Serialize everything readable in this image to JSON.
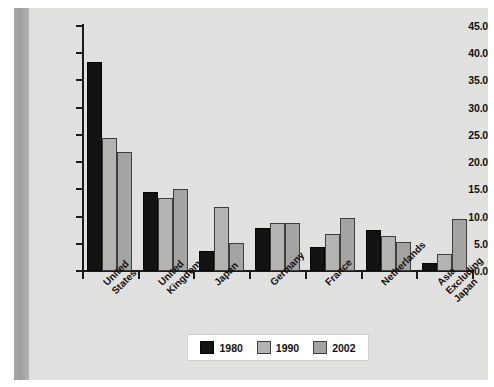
{
  "chart_data": {
    "type": "bar",
    "title": "",
    "subtitle": "",
    "xlabel": "",
    "ylabel": "",
    "ylim": [
      0.0,
      45.0
    ],
    "ytick_labels": [
      "0.0",
      "5.0",
      "10.0",
      "15.0",
      "20.0",
      "25.0",
      "30.0",
      "35.0",
      "40.0",
      "45.0"
    ],
    "ytick_values": [
      0.0,
      5.0,
      10.0,
      15.0,
      20.0,
      25.0,
      30.0,
      35.0,
      40.0,
      45.0
    ],
    "grid": false,
    "legend_position": "bottom-center",
    "categories": [
      "United States",
      "United Kingdom",
      "Japan",
      "Germany",
      "France",
      "Netherlands",
      "Asia Excluding Japan"
    ],
    "category_lines": [
      [
        "United",
        "States"
      ],
      [
        "United",
        "Kingdom"
      ],
      [
        "Japan"
      ],
      [
        "Germany"
      ],
      [
        "France"
      ],
      [
        "Netherlands"
      ],
      [
        "Asia",
        "Excluding",
        "Japan"
      ]
    ],
    "series": [
      {
        "name": "1980",
        "color": "#131313",
        "values": [
          38.3,
          14.5,
          3.7,
          7.9,
          4.4,
          7.6,
          1.5
        ]
      },
      {
        "name": "1990",
        "color": "#b3b3b1",
        "values": [
          24.5,
          13.4,
          11.8,
          8.8,
          6.8,
          6.5,
          3.2
        ]
      },
      {
        "name": "2002",
        "color": "#a3a3a1",
        "values": [
          21.9,
          15.0,
          5.1,
          8.8,
          9.8,
          5.4,
          9.6
        ]
      }
    ]
  },
  "legend": {
    "items": [
      {
        "label": "1980",
        "swatch": "black-swatch"
      },
      {
        "label": "1990",
        "swatch": "light-gray-swatch"
      },
      {
        "label": "2002",
        "swatch": "mid-gray-swatch"
      }
    ]
  },
  "colors": {
    "plate_background": "#e3e3e1",
    "axis": "#1b1b1b",
    "text": "#111111",
    "series_1980": "#131313",
    "series_1990": "#b3b3b1",
    "series_2002": "#a3a3a1",
    "legend_background": "#ffffff",
    "scan_gutter": "#9d9d9d"
  }
}
